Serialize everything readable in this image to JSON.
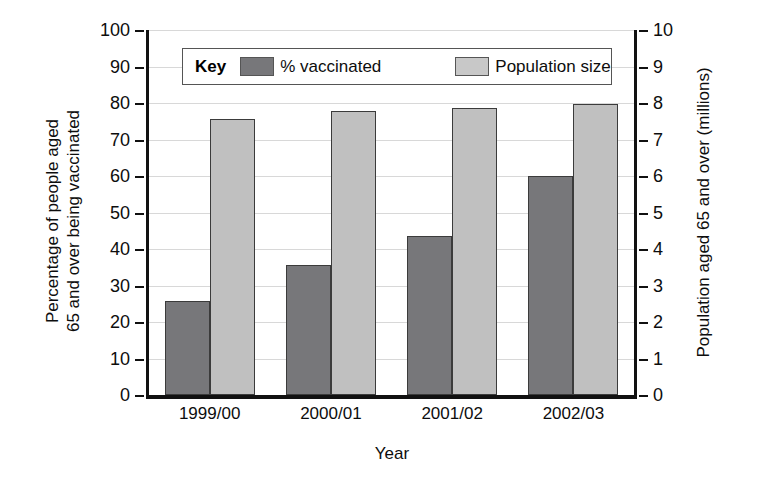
{
  "chart_data": {
    "type": "bar",
    "title": "",
    "xlabel": "Year",
    "categories": [
      "1999/00",
      "2000/01",
      "2001/02",
      "2002/03"
    ],
    "series": [
      {
        "name": "% vaccinated",
        "axis": "left",
        "color": "#77777a",
        "values": [
          25.7,
          35.6,
          43.6,
          60.0
        ]
      },
      {
        "name": "Population size",
        "axis": "right",
        "color": "#c0c0c0",
        "values": [
          7.55,
          7.77,
          7.86,
          7.98
        ]
      }
    ],
    "left_axis": {
      "label_line1": "Percentage of people aged",
      "label_line2": "65 and over being vaccinated",
      "ticks": [
        0,
        10,
        20,
        30,
        40,
        50,
        60,
        70,
        80,
        90,
        100
      ],
      "ylim": [
        0,
        100
      ]
    },
    "right_axis": {
      "label": "Population aged 65 and over (millions)",
      "ticks": [
        0,
        1,
        2,
        3,
        4,
        5,
        6,
        7,
        8,
        9,
        10
      ],
      "ylim": [
        0,
        10
      ]
    },
    "grid": true,
    "legend": {
      "position": "top-center",
      "title": "Key",
      "entries": [
        "% vaccinated",
        "Population size"
      ]
    }
  }
}
